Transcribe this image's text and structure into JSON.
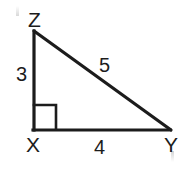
{
  "figure": {
    "kind": "right-triangle-geometry-diagram",
    "stroke_color": "#1c1c1c",
    "background_color": "#ffffff",
    "stroke_width": 3,
    "vertices": [
      {
        "name": "Z",
        "label": "Z",
        "x": 34,
        "y": 31,
        "label_x": 28,
        "label_y": 9
      },
      {
        "name": "X",
        "label": "X",
        "x": 34,
        "y": 130,
        "label_x": 26,
        "label_y": 134
      },
      {
        "name": "Y",
        "label": "Y",
        "x": 170,
        "y": 130,
        "label_x": 164,
        "label_y": 134
      }
    ],
    "sides": [
      {
        "name": "leg-XZ",
        "label": "3",
        "from": "X",
        "to": "Z",
        "label_x": 16,
        "label_y": 64
      },
      {
        "name": "hypotenuse-ZY",
        "label": "5",
        "from": "Z",
        "to": "Y",
        "label_x": 99,
        "label_y": 55
      },
      {
        "name": "leg-XY",
        "label": "4",
        "from": "X",
        "to": "Y",
        "label_x": 94,
        "label_y": 137
      }
    ],
    "right_angle": {
      "at_vertex": "X",
      "marker": "square",
      "x": 34,
      "y": 105,
      "size": 22
    }
  }
}
